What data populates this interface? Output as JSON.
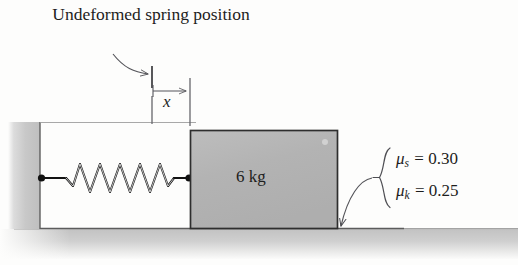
{
  "figure": {
    "caption": "Undeformed spring position",
    "displacement_label": "x",
    "block_mass_label": "6 kg",
    "friction": {
      "static": {
        "symbol": "μ",
        "subscript": "s",
        "equals": "=",
        "value": "0.30"
      },
      "kinetic": {
        "symbol": "μ",
        "subscript": "k",
        "equals": "=",
        "value": "0.25"
      }
    },
    "colors": {
      "background": "#fdfdfc",
      "ink": "#1d1d1d",
      "block_fill": "#b4b4b4",
      "wall_fill": "#c4c4c4",
      "ground_fill": "#c9c9c9",
      "annotation_line": "#55555a"
    },
    "elements": {
      "wall": "wall",
      "ground": "ground",
      "spring": "spring",
      "block": "block",
      "undeformed_position_marker": "undeformed-position-tick",
      "displacement_dimension": "displacement-dimension",
      "caption_leader": "caption-leader-arrow",
      "friction_brace": "friction-brace",
      "friction_leader": "friction-leader-arrow"
    }
  }
}
